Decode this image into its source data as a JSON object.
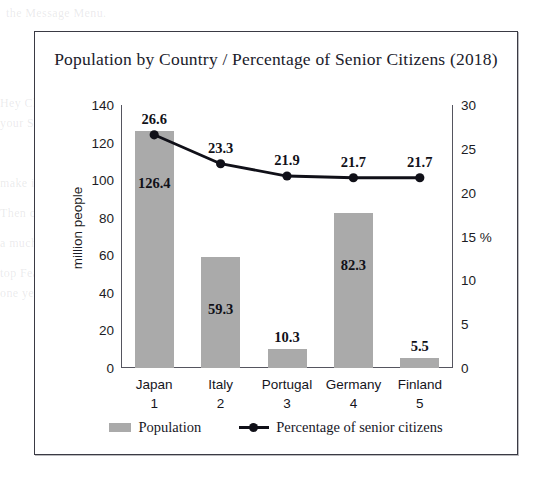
{
  "panel": {
    "title": "Population by Country / Percentage of Senior Citizens (2018)"
  },
  "background_text": {
    "line1": "the Message Menu.",
    "line2": "Hey Chris, Shawn, and Kevin. I have 3 quick tips",
    "line3": "your Startup Package? You're Welcome!",
    "line4": "make it work on your computer. Then Start sending.",
    "line5": "Then contact us and I will show you how.",
    "line6": "a much greater number. I will go to Internal",
    "line7": "top Features.",
    "line8": "one year ago. Then we shall have the complete"
  },
  "chart_data": {
    "type": "bar",
    "title": "Population by Country / Percentage of Senior Citizens (2018)",
    "categories": [
      "Japan",
      "Italy",
      "Portugal",
      "Germany",
      "Finland"
    ],
    "ranks": [
      "1",
      "2",
      "3",
      "4",
      "5"
    ],
    "xlabel": "",
    "ylabel": "million people",
    "ylabel_right": "%",
    "ylim": [
      0,
      140
    ],
    "ylim_right": [
      0,
      30
    ],
    "yticks": [
      "140",
      "120",
      "100",
      "80",
      "60",
      "40",
      "20",
      "0"
    ],
    "ytick_values": [
      140,
      120,
      100,
      80,
      60,
      40,
      20,
      0
    ],
    "yticks_right": [
      "30",
      "25",
      "20",
      "15 %",
      "10",
      "5",
      "0"
    ],
    "ytick_values_right": [
      30,
      25,
      20,
      15,
      10,
      5,
      0
    ],
    "grid": false,
    "legend_position": "bottom",
    "series": [
      {
        "name": "Population",
        "type": "bar",
        "axis": "left",
        "color": "#aaaaaa",
        "values": [
          126.4,
          59.3,
          10.3,
          82.3,
          5.5
        ],
        "labels": [
          "126.4",
          "59.3",
          "10.3",
          "82.3",
          "5.5"
        ]
      },
      {
        "name": "Percentage of senior citizens",
        "type": "line",
        "axis": "right",
        "color": "#101018",
        "values": [
          26.6,
          23.3,
          21.9,
          21.7,
          21.7
        ],
        "labels": [
          "26.6",
          "23.3",
          "21.9",
          "21.7",
          "21.7"
        ]
      }
    ]
  },
  "legend": {
    "items": [
      {
        "label": "Population"
      },
      {
        "label": "Percentage of senior citizens"
      }
    ]
  }
}
